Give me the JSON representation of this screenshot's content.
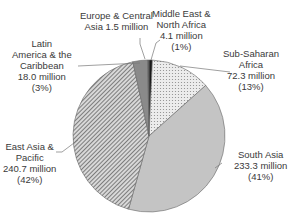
{
  "chart_data": {
    "type": "pie",
    "title": "",
    "unit": "million",
    "categories": [
      "Middle East & North Africa",
      "Sub-Saharan Africa",
      "South Asia",
      "East Asia & Pacific",
      "Latin America & the Caribbean",
      "Europe & Central Asia"
    ],
    "values": [
      4.1,
      72.3,
      233.3,
      240.7,
      18.0,
      1.5
    ],
    "percentages": [
      "1%",
      "13%",
      "41%",
      "42%",
      "3%",
      ""
    ],
    "fills": [
      "#1a1a1a",
      "dots",
      "#c4c4c4",
      "diagonal-hatch",
      "#8a8a8a",
      "#5a5a5a"
    ],
    "legend": "none (leader-line labels)",
    "start_angle_deg": 0,
    "direction": "clockwise"
  },
  "labels": [
    {
      "name": "middle-east",
      "lines": [
        "Middle East &",
        "North Africa",
        "4.1 million",
        "(1%)"
      ]
    },
    {
      "name": "sub-saharan",
      "lines": [
        "Sub-Saharan",
        "Africa",
        "72.3 million",
        "(13%)"
      ]
    },
    {
      "name": "south-asia",
      "lines": [
        "South Asia",
        "233.3 million",
        "(41%)"
      ]
    },
    {
      "name": "east-asia",
      "lines": [
        "East Asia &",
        "Pacific",
        "240.7 million",
        "(42%)"
      ]
    },
    {
      "name": "latin-america",
      "lines": [
        "Latin",
        "America & the",
        "Caribbean",
        "18.0 million",
        "(3%)"
      ]
    },
    {
      "name": "europe",
      "lines": [
        "Europe & Central",
        "Asia 1.5 million"
      ]
    }
  ]
}
